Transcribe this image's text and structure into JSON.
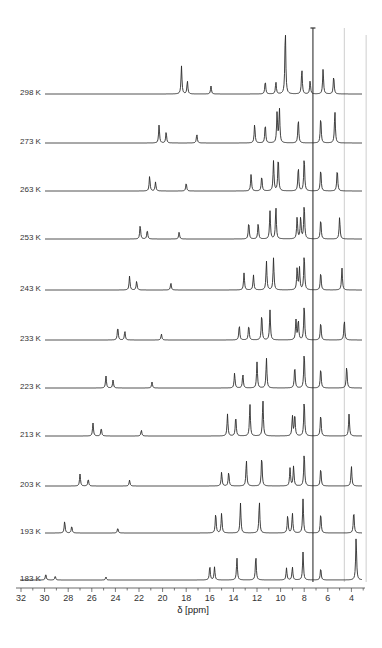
{
  "chart_data": {
    "type": "line",
    "title": "",
    "xlabel": "δ [ppm]",
    "ylabel": "",
    "x_axis": {
      "min": 32,
      "max": 3,
      "reversed": true,
      "ticks": [
        32,
        30,
        28,
        26,
        24,
        22,
        20,
        18,
        16,
        14,
        12,
        10,
        8,
        6,
        4
      ],
      "minor_step": 1
    },
    "grid": false,
    "legend": "none",
    "reference_lines": [
      {
        "ppm": 7.26,
        "style": "dark",
        "note": "T-capped solvent line"
      },
      {
        "ppm": 4.6,
        "style": "light-gray"
      },
      {
        "ppm": 2.75,
        "style": "light-gray"
      }
    ],
    "series": [
      {
        "name": "298 K",
        "baseline_y": 94,
        "peaks": [
          {
            "ppm": 18.4,
            "h": 28
          },
          {
            "ppm": 17.9,
            "h": 13
          },
          {
            "ppm": 15.9,
            "h": 8
          },
          {
            "ppm": 11.3,
            "h": 13
          },
          {
            "ppm": 10.4,
            "h": 12
          },
          {
            "ppm": 9.6,
            "h": 65
          },
          {
            "ppm": 8.2,
            "h": 25
          },
          {
            "ppm": 7.5,
            "h": 13
          },
          {
            "ppm": 6.4,
            "h": 25
          },
          {
            "ppm": 5.5,
            "h": 18
          }
        ]
      },
      {
        "name": "273 K",
        "baseline_y": 143,
        "peaks": [
          {
            "ppm": 20.3,
            "h": 18
          },
          {
            "ppm": 19.7,
            "h": 11
          },
          {
            "ppm": 17.1,
            "h": 9
          },
          {
            "ppm": 12.2,
            "h": 19
          },
          {
            "ppm": 11.3,
            "h": 19
          },
          {
            "ppm": 10.3,
            "h": 30
          },
          {
            "ppm": 10.1,
            "h": 34
          },
          {
            "ppm": 8.5,
            "h": 24
          },
          {
            "ppm": 6.6,
            "h": 26
          },
          {
            "ppm": 5.4,
            "h": 32
          }
        ]
      },
      {
        "name": "263 K",
        "baseline_y": 191,
        "peaks": [
          {
            "ppm": 21.1,
            "h": 15
          },
          {
            "ppm": 20.6,
            "h": 9
          },
          {
            "ppm": 18.0,
            "h": 8
          },
          {
            "ppm": 12.5,
            "h": 17
          },
          {
            "ppm": 11.6,
            "h": 15
          },
          {
            "ppm": 10.6,
            "h": 30
          },
          {
            "ppm": 10.2,
            "h": 34
          },
          {
            "ppm": 8.5,
            "h": 24
          },
          {
            "ppm": 8.0,
            "h": 34
          },
          {
            "ppm": 6.6,
            "h": 22
          },
          {
            "ppm": 5.2,
            "h": 22
          }
        ]
      },
      {
        "name": "253 K",
        "baseline_y": 239,
        "peaks": [
          {
            "ppm": 21.9,
            "h": 14
          },
          {
            "ppm": 21.3,
            "h": 9
          },
          {
            "ppm": 18.6,
            "h": 7
          },
          {
            "ppm": 12.7,
            "h": 17
          },
          {
            "ppm": 11.9,
            "h": 16
          },
          {
            "ppm": 10.9,
            "h": 28
          },
          {
            "ppm": 10.4,
            "h": 32
          },
          {
            "ppm": 8.6,
            "h": 22
          },
          {
            "ppm": 8.3,
            "h": 22
          },
          {
            "ppm": 8.0,
            "h": 35
          },
          {
            "ppm": 6.6,
            "h": 20
          },
          {
            "ppm": 5.0,
            "h": 22
          }
        ]
      },
      {
        "name": "243 K",
        "baseline_y": 290,
        "peaks": [
          {
            "ppm": 22.8,
            "h": 14
          },
          {
            "ppm": 22.2,
            "h": 9
          },
          {
            "ppm": 19.3,
            "h": 7
          },
          {
            "ppm": 13.1,
            "h": 17
          },
          {
            "ppm": 12.3,
            "h": 15
          },
          {
            "ppm": 11.2,
            "h": 29
          },
          {
            "ppm": 10.6,
            "h": 32
          },
          {
            "ppm": 8.6,
            "h": 22
          },
          {
            "ppm": 8.4,
            "h": 22
          },
          {
            "ppm": 8.0,
            "h": 36
          },
          {
            "ppm": 6.6,
            "h": 18
          },
          {
            "ppm": 4.8,
            "h": 22
          }
        ]
      },
      {
        "name": "233 K",
        "baseline_y": 340,
        "peaks": [
          {
            "ppm": 23.8,
            "h": 13
          },
          {
            "ppm": 23.2,
            "h": 9
          },
          {
            "ppm": 20.1,
            "h": 6
          },
          {
            "ppm": 13.5,
            "h": 15
          },
          {
            "ppm": 12.7,
            "h": 15
          },
          {
            "ppm": 11.6,
            "h": 26
          },
          {
            "ppm": 10.9,
            "h": 30
          },
          {
            "ppm": 8.7,
            "h": 20
          },
          {
            "ppm": 8.5,
            "h": 20
          },
          {
            "ppm": 8.0,
            "h": 36
          },
          {
            "ppm": 6.6,
            "h": 18
          },
          {
            "ppm": 4.6,
            "h": 20
          }
        ]
      },
      {
        "name": "223 K",
        "baseline_y": 388,
        "peaks": [
          {
            "ppm": 24.8,
            "h": 12
          },
          {
            "ppm": 24.2,
            "h": 8
          },
          {
            "ppm": 20.9,
            "h": 6
          },
          {
            "ppm": 13.9,
            "h": 15
          },
          {
            "ppm": 13.2,
            "h": 14
          },
          {
            "ppm": 12.0,
            "h": 26
          },
          {
            "ppm": 11.2,
            "h": 30
          },
          {
            "ppm": 8.8,
            "h": 22
          },
          {
            "ppm": 8.0,
            "h": 36
          },
          {
            "ppm": 6.6,
            "h": 20
          },
          {
            "ppm": 4.4,
            "h": 22
          }
        ]
      },
      {
        "name": "213 K",
        "baseline_y": 436,
        "peaks": [
          {
            "ppm": 25.9,
            "h": 13
          },
          {
            "ppm": 25.2,
            "h": 8
          },
          {
            "ppm": 21.8,
            "h": 6
          },
          {
            "ppm": 14.5,
            "h": 22
          },
          {
            "ppm": 13.8,
            "h": 20
          },
          {
            "ppm": 12.6,
            "h": 32
          },
          {
            "ppm": 11.5,
            "h": 36
          },
          {
            "ppm": 9.0,
            "h": 20
          },
          {
            "ppm": 8.8,
            "h": 22
          },
          {
            "ppm": 8.0,
            "h": 36
          },
          {
            "ppm": 6.6,
            "h": 22
          },
          {
            "ppm": 4.2,
            "h": 22
          }
        ]
      },
      {
        "name": "203 K",
        "baseline_y": 486,
        "peaks": [
          {
            "ppm": 27.0,
            "h": 12
          },
          {
            "ppm": 26.3,
            "h": 7
          },
          {
            "ppm": 22.8,
            "h": 6
          },
          {
            "ppm": 15.0,
            "h": 14
          },
          {
            "ppm": 14.4,
            "h": 14
          },
          {
            "ppm": 12.9,
            "h": 26
          },
          {
            "ppm": 11.6,
            "h": 30
          },
          {
            "ppm": 9.2,
            "h": 18
          },
          {
            "ppm": 8.9,
            "h": 20
          },
          {
            "ppm": 8.0,
            "h": 34
          },
          {
            "ppm": 6.6,
            "h": 18
          },
          {
            "ppm": 4.0,
            "h": 20
          }
        ]
      },
      {
        "name": "193 K",
        "baseline_y": 533,
        "peaks": [
          {
            "ppm": 28.3,
            "h": 12
          },
          {
            "ppm": 27.7,
            "h": 7
          },
          {
            "ppm": 23.8,
            "h": 5
          },
          {
            "ppm": 15.5,
            "h": 20
          },
          {
            "ppm": 15.0,
            "h": 20
          },
          {
            "ppm": 13.4,
            "h": 30
          },
          {
            "ppm": 11.8,
            "h": 32
          },
          {
            "ppm": 9.4,
            "h": 18
          },
          {
            "ppm": 9.0,
            "h": 20
          },
          {
            "ppm": 8.1,
            "h": 34
          },
          {
            "ppm": 6.6,
            "h": 20
          },
          {
            "ppm": 3.8,
            "h": 22
          }
        ]
      },
      {
        "name": "183 K",
        "baseline_y": 580,
        "peaks": [
          {
            "ppm": 29.9,
            "h": 6
          },
          {
            "ppm": 29.1,
            "h": 4
          },
          {
            "ppm": 24.8,
            "h": 3
          },
          {
            "ppm": 16.0,
            "h": 14
          },
          {
            "ppm": 15.6,
            "h": 13
          },
          {
            "ppm": 13.7,
            "h": 22
          },
          {
            "ppm": 12.1,
            "h": 24
          },
          {
            "ppm": 9.5,
            "h": 12
          },
          {
            "ppm": 9.0,
            "h": 13
          },
          {
            "ppm": 8.1,
            "h": 28
          },
          {
            "ppm": 6.6,
            "h": 12
          },
          {
            "ppm": 3.6,
            "h": 43
          }
        ]
      }
    ]
  },
  "axis": {
    "xlabel": "δ [ppm]",
    "tick_labels": [
      "32",
      "30",
      "28",
      "26",
      "24",
      "22",
      "20",
      "18",
      "16",
      "14",
      "12",
      "10",
      "8",
      "6",
      "4"
    ]
  },
  "labels": [
    "298 K",
    "273 K",
    "263 K",
    "253 K",
    "243 K",
    "233 K",
    "223 K",
    "213 K",
    "203 K",
    "193 K",
    "183 K"
  ],
  "colors": {
    "trace": "#2b2b2b",
    "ref_dark": "#333333",
    "ref_light": "#c8c8c8",
    "text": "#333333"
  }
}
